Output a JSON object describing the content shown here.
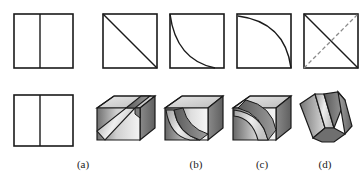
{
  "figure": {
    "background_color": "#ffffff",
    "line_color": "#1a1a1a",
    "hidden_line_color": "#8a8a8a",
    "face_light_color": "#f2f2f2",
    "face_mid_color": "#b8b8b8",
    "face_dark_color": "#6e6e6e",
    "rows": 2,
    "columns": 5
  },
  "top_row": {
    "row_name": "orthographic-views",
    "views": [
      {
        "index": 0,
        "name": "square-with-vertical-center-line",
        "description": "Square outline divided by a vertical line left of center",
        "kind": "square-with-line"
      },
      {
        "index": 1,
        "name": "square-with-diagonal",
        "description": "Square outline with a straight diagonal from top-left to bottom-right",
        "kind": "square-with-diagonal"
      },
      {
        "index": 2,
        "name": "square-with-concave-curve",
        "description": "Square outline with a concave curve from top-left down to bottom-right",
        "kind": "square-with-concave-curve"
      },
      {
        "index": 3,
        "name": "square-with-convex-curve",
        "description": "Square outline with a convex curve from top-left across to bottom-right",
        "kind": "square-with-convex-curve"
      },
      {
        "index": 4,
        "name": "square-with-crossed-diagonals",
        "description": "Square outline with an X; the rising diagonal is a dashed hidden line",
        "kind": "square-with-crossed-diagonals"
      }
    ]
  },
  "bottom_row": {
    "row_name": "pictorial-solids",
    "solids": [
      {
        "index": 0,
        "name": "flat-plate-front-view",
        "description": "Square outline divided by a vertical line left of center",
        "kind": "square-with-line",
        "caption": ""
      },
      {
        "index": 1,
        "name": "cube-with-slanted-slot",
        "description": "Isometric cube with a straight slanted slot cut through it",
        "kind": "solid-slanted",
        "caption": "(a)"
      },
      {
        "index": 2,
        "name": "cube-with-concave-groove",
        "description": "Isometric cube with a concave curved groove cut through it",
        "kind": "solid-concave",
        "caption": "(b)"
      },
      {
        "index": 3,
        "name": "cube-with-convex-groove",
        "description": "Isometric cube with a convex curved groove cut through it",
        "kind": "solid-convex",
        "caption": "(c)"
      },
      {
        "index": 4,
        "name": "v-shaped-solid",
        "description": "Isometric V-shaped solid formed by two inclined planes",
        "kind": "solid-vee",
        "caption": "(d)"
      }
    ]
  },
  "captions": {
    "items": [
      {
        "name": "caption-a",
        "label": "(a)",
        "x": 83,
        "y": 168
      },
      {
        "name": "caption-b",
        "label": "(b)",
        "x": 196,
        "y": 168
      },
      {
        "name": "caption-c",
        "label": "(c)",
        "x": 262,
        "y": 168
      },
      {
        "name": "caption-d",
        "label": "(d)",
        "x": 325,
        "y": 168
      }
    ]
  }
}
